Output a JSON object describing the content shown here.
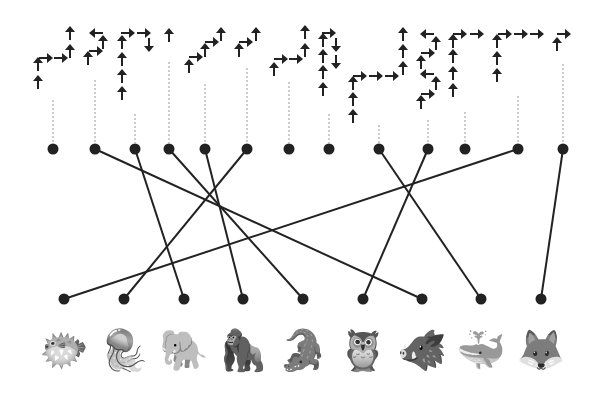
{
  "puzzle": {
    "type": "arrow-path matching puzzle",
    "colors": {
      "ink": "#222222",
      "dotted": "#999999",
      "background": "#ffffff"
    },
    "top_dots": [
      {
        "x": 53,
        "y": 149,
        "dotted_top": 100
      },
      {
        "x": 95,
        "y": 149,
        "dotted_top": 80
      },
      {
        "x": 135,
        "y": 149,
        "dotted_top": 114
      },
      {
        "x": 169,
        "y": 149,
        "dotted_top": 62
      },
      {
        "x": 205,
        "y": 149,
        "dotted_top": 84
      },
      {
        "x": 247,
        "y": 149,
        "dotted_top": 68
      },
      {
        "x": 289,
        "y": 149,
        "dotted_top": 82
      },
      {
        "x": 329,
        "y": 149,
        "dotted_top": 114
      },
      {
        "x": 379,
        "y": 149,
        "dotted_top": 125
      },
      {
        "x": 428,
        "y": 149,
        "dotted_top": 120
      },
      {
        "x": 465,
        "y": 149,
        "dotted_top": 112
      },
      {
        "x": 518,
        "y": 149,
        "dotted_top": 96
      },
      {
        "x": 563,
        "y": 149,
        "dotted_top": 64
      }
    ],
    "bottom_dots": [
      {
        "x": 64,
        "y": 299
      },
      {
        "x": 124,
        "y": 299
      },
      {
        "x": 184,
        "y": 299
      },
      {
        "x": 243,
        "y": 299
      },
      {
        "x": 303,
        "y": 299
      },
      {
        "x": 363,
        "y": 299
      },
      {
        "x": 422,
        "y": 299
      },
      {
        "x": 481,
        "y": 299
      },
      {
        "x": 541,
        "y": 299
      }
    ],
    "connections": [
      {
        "from_top": 1,
        "to_bottom": 6
      },
      {
        "from_top": 2,
        "to_bottom": 2
      },
      {
        "from_top": 3,
        "to_bottom": 4
      },
      {
        "from_top": 4,
        "to_bottom": 3
      },
      {
        "from_top": 5,
        "to_bottom": 1
      },
      {
        "from_top": 8,
        "to_bottom": 7
      },
      {
        "from_top": 9,
        "to_bottom": 5
      },
      {
        "from_top": 11,
        "to_bottom": 0
      },
      {
        "from_top": 12,
        "to_bottom": 8
      }
    ],
    "arrows": [
      {
        "x": 38,
        "y": 82,
        "d": "up"
      },
      {
        "x": 38,
        "y": 64,
        "d": "up"
      },
      {
        "x": 46,
        "y": 58,
        "d": "right"
      },
      {
        "x": 61,
        "y": 58,
        "d": "right"
      },
      {
        "x": 70,
        "y": 51,
        "d": "up"
      },
      {
        "x": 70,
        "y": 33,
        "d": "up"
      },
      {
        "x": 88,
        "y": 58,
        "d": "up"
      },
      {
        "x": 96,
        "y": 51,
        "d": "right"
      },
      {
        "x": 103,
        "y": 42,
        "d": "up"
      },
      {
        "x": 96,
        "y": 33,
        "d": "left"
      },
      {
        "x": 122,
        "y": 93,
        "d": "up"
      },
      {
        "x": 122,
        "y": 76,
        "d": "up"
      },
      {
        "x": 122,
        "y": 59,
        "d": "up"
      },
      {
        "x": 122,
        "y": 42,
        "d": "up"
      },
      {
        "x": 128,
        "y": 33,
        "d": "right"
      },
      {
        "x": 144,
        "y": 33,
        "d": "right"
      },
      {
        "x": 149,
        "y": 45,
        "d": "down"
      },
      {
        "x": 169,
        "y": 35,
        "d": "up"
      },
      {
        "x": 189,
        "y": 66,
        "d": "up"
      },
      {
        "x": 196,
        "y": 57,
        "d": "right"
      },
      {
        "x": 205,
        "y": 50,
        "d": "up"
      },
      {
        "x": 212,
        "y": 42,
        "d": "right"
      },
      {
        "x": 221,
        "y": 34,
        "d": "up"
      },
      {
        "x": 239,
        "y": 50,
        "d": "up"
      },
      {
        "x": 246,
        "y": 42,
        "d": "right"
      },
      {
        "x": 256,
        "y": 34,
        "d": "up"
      },
      {
        "x": 274,
        "y": 69,
        "d": "up"
      },
      {
        "x": 281,
        "y": 59,
        "d": "right"
      },
      {
        "x": 296,
        "y": 59,
        "d": "right"
      },
      {
        "x": 305,
        "y": 50,
        "d": "up"
      },
      {
        "x": 305,
        "y": 32,
        "d": "up"
      },
      {
        "x": 323,
        "y": 89,
        "d": "up"
      },
      {
        "x": 323,
        "y": 72,
        "d": "up"
      },
      {
        "x": 323,
        "y": 56,
        "d": "up"
      },
      {
        "x": 323,
        "y": 40,
        "d": "up"
      },
      {
        "x": 329,
        "y": 33,
        "d": "right"
      },
      {
        "x": 336,
        "y": 45,
        "d": "down"
      },
      {
        "x": 336,
        "y": 62,
        "d": "down"
      },
      {
        "x": 353,
        "y": 116,
        "d": "up"
      },
      {
        "x": 353,
        "y": 99,
        "d": "up"
      },
      {
        "x": 353,
        "y": 83,
        "d": "up"
      },
      {
        "x": 360,
        "y": 76,
        "d": "right"
      },
      {
        "x": 376,
        "y": 76,
        "d": "right"
      },
      {
        "x": 392,
        "y": 76,
        "d": "right"
      },
      {
        "x": 403,
        "y": 68,
        "d": "up"
      },
      {
        "x": 403,
        "y": 51,
        "d": "up"
      },
      {
        "x": 403,
        "y": 34,
        "d": "up"
      },
      {
        "x": 421,
        "y": 102,
        "d": "up"
      },
      {
        "x": 428,
        "y": 94,
        "d": "right"
      },
      {
        "x": 436,
        "y": 83,
        "d": "up"
      },
      {
        "x": 427,
        "y": 74,
        "d": "left"
      },
      {
        "x": 421,
        "y": 62,
        "d": "up"
      },
      {
        "x": 428,
        "y": 53,
        "d": "right"
      },
      {
        "x": 436,
        "y": 43,
        "d": "up"
      },
      {
        "x": 427,
        "y": 34,
        "d": "left"
      },
      {
        "x": 453,
        "y": 90,
        "d": "up"
      },
      {
        "x": 453,
        "y": 73,
        "d": "up"
      },
      {
        "x": 453,
        "y": 56,
        "d": "up"
      },
      {
        "x": 453,
        "y": 41,
        "d": "up"
      },
      {
        "x": 460,
        "y": 34,
        "d": "right"
      },
      {
        "x": 477,
        "y": 34,
        "d": "right"
      },
      {
        "x": 497,
        "y": 75,
        "d": "up"
      },
      {
        "x": 497,
        "y": 58,
        "d": "up"
      },
      {
        "x": 497,
        "y": 41,
        "d": "up"
      },
      {
        "x": 505,
        "y": 34,
        "d": "right"
      },
      {
        "x": 521,
        "y": 34,
        "d": "right"
      },
      {
        "x": 537,
        "y": 34,
        "d": "right"
      },
      {
        "x": 557,
        "y": 44,
        "d": "up"
      },
      {
        "x": 564,
        "y": 34,
        "d": "right"
      }
    ],
    "animals": [
      {
        "name": "pufferfish",
        "glyph": "🐡",
        "x": 64
      },
      {
        "name": "jellyfish",
        "glyph": "🪼",
        "x": 124
      },
      {
        "name": "elephant",
        "glyph": "🐘",
        "x": 184
      },
      {
        "name": "gorilla",
        "glyph": "🦍",
        "x": 243
      },
      {
        "name": "crocodile",
        "glyph": "🐊",
        "x": 303
      },
      {
        "name": "owl",
        "glyph": "🦉",
        "x": 363
      },
      {
        "name": "boar",
        "glyph": "🐗",
        "x": 422
      },
      {
        "name": "whale",
        "glyph": "🐳",
        "x": 481
      },
      {
        "name": "fox",
        "glyph": "🦊",
        "x": 541
      }
    ]
  }
}
